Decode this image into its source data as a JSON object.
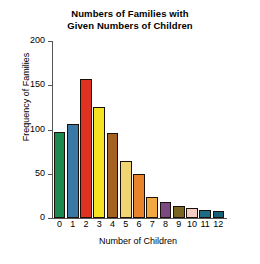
{
  "chart_data": {
    "type": "bar",
    "title": "Numbers of Families with Given Numbers of Children",
    "title_lines": [
      "Numbers of Families with",
      "Given Numbers of Children"
    ],
    "xlabel": "Number of Children",
    "ylabel": "Frequency of Families",
    "categories": [
      "0",
      "1",
      "2",
      "3",
      "4",
      "5",
      "6",
      "7",
      "8",
      "9",
      "10",
      "11",
      "12"
    ],
    "values": [
      97,
      106,
      157,
      126,
      96,
      64,
      50,
      24,
      18,
      14,
      11,
      9,
      8
    ],
    "bar_colors": [
      "#1a8a4e",
      "#3a79a6",
      "#e03221",
      "#f5e222",
      "#a5611f",
      "#f1d573",
      "#e8822b",
      "#f2a941",
      "#7b4a83",
      "#7a6520",
      "#f2cbc2",
      "#1f6a84",
      "#1a5f78"
    ],
    "bar_edge_color": "#1a1008",
    "ylim": [
      0,
      200
    ],
    "yticks": [
      0,
      50,
      100,
      150,
      200
    ],
    "ytick_labels": [
      "0",
      "50",
      "100",
      "150",
      "200"
    ],
    "xlim": [
      -0.6,
      12.6
    ],
    "grid": false,
    "legend": false,
    "legend_position": "none",
    "axis_color": "#555555",
    "background_color": "#ffffff"
  }
}
